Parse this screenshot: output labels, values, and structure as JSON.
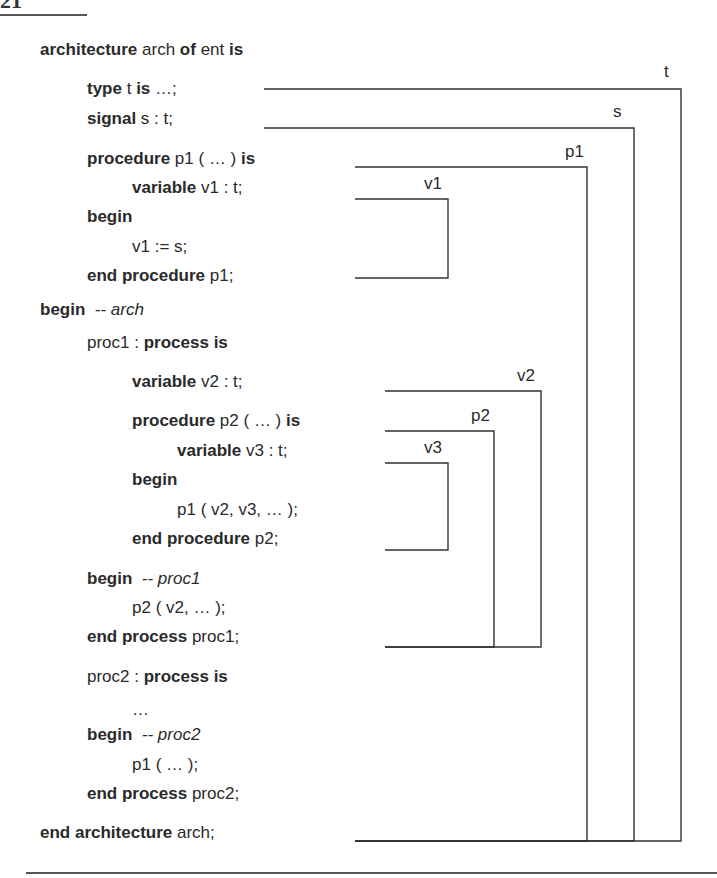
{
  "page": {
    "number": "21"
  },
  "code": {
    "lines": [
      {
        "indent": 0,
        "y": 40,
        "parts": [
          [
            "kw",
            "architecture"
          ],
          [
            "tx",
            " arch "
          ],
          [
            "kw",
            "of"
          ],
          [
            "tx",
            " ent "
          ],
          [
            "kw",
            "is"
          ]
        ]
      },
      {
        "indent": 1,
        "y": 79,
        "parts": [
          [
            "kw",
            "type"
          ],
          [
            "tx",
            " t "
          ],
          [
            "kw",
            "is"
          ],
          [
            "tx",
            " …;"
          ]
        ]
      },
      {
        "indent": 1,
        "y": 109,
        "parts": [
          [
            "kw",
            "signal"
          ],
          [
            "tx",
            " s : t;"
          ]
        ]
      },
      {
        "indent": 1,
        "y": 149,
        "parts": [
          [
            "kw",
            "procedure"
          ],
          [
            "tx",
            " p1 ( … ) "
          ],
          [
            "kw",
            "is"
          ]
        ]
      },
      {
        "indent": 2,
        "y": 178,
        "parts": [
          [
            "kw",
            "variable"
          ],
          [
            "tx",
            " v1 : t;"
          ]
        ]
      },
      {
        "indent": 1,
        "y": 207,
        "parts": [
          [
            "kw",
            "begin"
          ]
        ]
      },
      {
        "indent": 2,
        "y": 237,
        "parts": [
          [
            "tx",
            "v1 := s;"
          ]
        ]
      },
      {
        "indent": 1,
        "y": 266,
        "parts": [
          [
            "kw",
            "end procedure"
          ],
          [
            "tx",
            " p1;"
          ]
        ]
      },
      {
        "indent": 0,
        "y": 300,
        "parts": [
          [
            "kw",
            "begin"
          ],
          [
            "tx",
            "  "
          ],
          [
            "cm",
            "-- arch"
          ]
        ]
      },
      {
        "indent": 1,
        "y": 333,
        "parts": [
          [
            "tx",
            "proc1 : "
          ],
          [
            "kw",
            "process is"
          ]
        ]
      },
      {
        "indent": 2,
        "y": 372,
        "parts": [
          [
            "kw",
            "variable"
          ],
          [
            "tx",
            " v2 : t;"
          ]
        ]
      },
      {
        "indent": 2,
        "y": 411,
        "parts": [
          [
            "kw",
            "procedure"
          ],
          [
            "tx",
            " p2 ( … ) "
          ],
          [
            "kw",
            "is"
          ]
        ]
      },
      {
        "indent": 3,
        "y": 441,
        "parts": [
          [
            "kw",
            "variable"
          ],
          [
            "tx",
            " v3 : t;"
          ]
        ]
      },
      {
        "indent": 2,
        "y": 470,
        "parts": [
          [
            "kw",
            "begin"
          ]
        ]
      },
      {
        "indent": 3,
        "y": 500,
        "parts": [
          [
            "tx",
            "p1 ( v2, v3, … );"
          ]
        ]
      },
      {
        "indent": 2,
        "y": 529,
        "parts": [
          [
            "kw",
            "end procedure"
          ],
          [
            "tx",
            " p2;"
          ]
        ]
      },
      {
        "indent": 1,
        "y": 569,
        "parts": [
          [
            "kw",
            "begin"
          ],
          [
            "tx",
            "  "
          ],
          [
            "cm",
            "-- proc1"
          ]
        ]
      },
      {
        "indent": 2,
        "y": 598,
        "parts": [
          [
            "tx",
            "p2 ( v2, … );"
          ]
        ]
      },
      {
        "indent": 1,
        "y": 627,
        "parts": [
          [
            "kw",
            "end process"
          ],
          [
            "tx",
            " proc1;"
          ]
        ]
      },
      {
        "indent": 1,
        "y": 667,
        "parts": [
          [
            "tx",
            "proc2 : "
          ],
          [
            "kw",
            "process is"
          ]
        ]
      },
      {
        "indent": 2,
        "y": 700,
        "parts": [
          [
            "tx",
            "…"
          ]
        ]
      },
      {
        "indent": 1,
        "y": 725,
        "parts": [
          [
            "kw",
            "begin"
          ],
          [
            "tx",
            "  "
          ],
          [
            "cm",
            "-- proc2"
          ]
        ]
      },
      {
        "indent": 2,
        "y": 755,
        "parts": [
          [
            "tx",
            "p1 ( … );"
          ]
        ]
      },
      {
        "indent": 1,
        "y": 784,
        "parts": [
          [
            "kw",
            "end process"
          ],
          [
            "tx",
            " proc2;"
          ]
        ]
      },
      {
        "indent": 0,
        "y": 823,
        "parts": [
          [
            "kw",
            "end architecture"
          ],
          [
            "tx",
            " arch;"
          ]
        ]
      }
    ]
  },
  "scopes": [
    {
      "name": "t",
      "x1": 264,
      "ytop": 89,
      "xv": 681,
      "ybot": 841,
      "label_x": 664,
      "label_y": 62
    },
    {
      "name": "s",
      "x1": 264,
      "ytop": 128,
      "xv": 634,
      "ybot": 841,
      "label_x": 613,
      "label_y": 102
    },
    {
      "name": "p1",
      "x1": 355,
      "ytop": 167,
      "xv": 587,
      "ybot": 841,
      "label_x": 565,
      "label_y": 142
    },
    {
      "name": "v1",
      "x1": 355,
      "ytop": 199,
      "xv": 448,
      "ybot": 278,
      "label_x": 424,
      "label_y": 174
    },
    {
      "name": "v2",
      "x1": 385,
      "ytop": 391,
      "xv": 541,
      "ybot": 647,
      "label_x": 517,
      "label_y": 366
    },
    {
      "name": "p2",
      "x1": 385,
      "ytop": 431,
      "xv": 494,
      "ybot": 647,
      "label_x": 471,
      "label_y": 406
    },
    {
      "name": "v3",
      "x1": 385,
      "ytop": 463,
      "xv": 448,
      "ybot": 550,
      "label_x": 424,
      "label_y": 438
    }
  ],
  "layout": {
    "indent_x": [
      40,
      87,
      132,
      177
    ]
  }
}
